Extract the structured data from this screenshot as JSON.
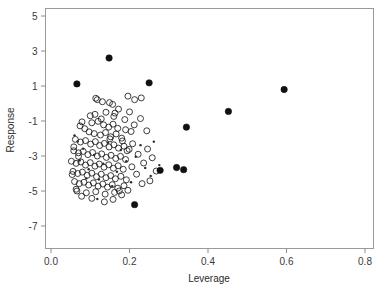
{
  "chart_data": {
    "type": "scatter",
    "title": "",
    "xlabel": "Leverage",
    "ylabel": "Response",
    "xlim": [
      0.0,
      0.82
    ],
    "ylim": [
      -7.6,
      5.5
    ],
    "grid": false,
    "legend": "none",
    "xticks": [
      "0.0",
      "0.2",
      "0.4",
      "0.6",
      "0.8"
    ],
    "xtick_values": [
      0.0,
      0.2,
      0.4,
      0.6,
      0.8
    ],
    "yticks": [
      "5",
      "3",
      "1",
      "-1",
      "-3",
      "-5",
      "-7"
    ],
    "ytick_values": [
      5,
      3,
      1,
      -1,
      -3,
      -5,
      -7
    ],
    "series": [
      {
        "name": "open-circles",
        "marker": "open-circle",
        "marker_size": 3.0,
        "color": "#1c1c1c",
        "points": [
          [
            0.114,
            0.3
          ],
          [
            0.118,
            0.22
          ],
          [
            0.131,
            0.1
          ],
          [
            0.149,
            0.05
          ],
          [
            0.157,
            -0.05
          ],
          [
            0.196,
            0.42
          ],
          [
            0.213,
            0.22
          ],
          [
            0.23,
            0.32
          ],
          [
            0.14,
            -0.5
          ],
          [
            0.163,
            -0.55
          ],
          [
            0.112,
            -0.62
          ],
          [
            0.079,
            -1.05
          ],
          [
            0.104,
            -1.1
          ],
          [
            0.12,
            -1.02
          ],
          [
            0.134,
            -1.22
          ],
          [
            0.147,
            -1.35
          ],
          [
            0.158,
            -1.18
          ],
          [
            0.17,
            -1.42
          ],
          [
            0.19,
            -1.5
          ],
          [
            0.097,
            -1.62
          ],
          [
            0.11,
            -1.72
          ],
          [
            0.126,
            -1.8
          ],
          [
            0.139,
            -1.66
          ],
          [
            0.152,
            -1.9
          ],
          [
            0.166,
            -1.74
          ],
          [
            0.18,
            -1.98
          ],
          [
            0.204,
            -1.6
          ],
          [
            0.062,
            -2.05
          ],
          [
            0.075,
            -2.2
          ],
          [
            0.088,
            -2.12
          ],
          [
            0.101,
            -2.32
          ],
          [
            0.113,
            -2.18
          ],
          [
            0.124,
            -2.4
          ],
          [
            0.136,
            -2.28
          ],
          [
            0.148,
            -2.48
          ],
          [
            0.16,
            -2.36
          ],
          [
            0.172,
            -2.55
          ],
          [
            0.186,
            -2.44
          ],
          [
            0.199,
            -2.62
          ],
          [
            0.058,
            -2.7
          ],
          [
            0.07,
            -2.82
          ],
          [
            0.082,
            -2.74
          ],
          [
            0.094,
            -2.92
          ],
          [
            0.106,
            -2.8
          ],
          [
            0.118,
            -3.0
          ],
          [
            0.129,
            -2.88
          ],
          [
            0.141,
            -3.08
          ],
          [
            0.153,
            -2.96
          ],
          [
            0.165,
            -3.14
          ],
          [
            0.177,
            -3.02
          ],
          [
            0.19,
            -3.2
          ],
          [
            0.052,
            -3.3
          ],
          [
            0.064,
            -3.42
          ],
          [
            0.076,
            -3.34
          ],
          [
            0.088,
            -3.52
          ],
          [
            0.1,
            -3.38
          ],
          [
            0.112,
            -3.58
          ],
          [
            0.123,
            -3.46
          ],
          [
            0.135,
            -3.64
          ],
          [
            0.147,
            -3.5
          ],
          [
            0.159,
            -3.7
          ],
          [
            0.171,
            -3.56
          ],
          [
            0.184,
            -3.76
          ],
          [
            0.056,
            -3.88
          ],
          [
            0.068,
            -4.0
          ],
          [
            0.08,
            -3.92
          ],
          [
            0.092,
            -4.1
          ],
          [
            0.104,
            -3.98
          ],
          [
            0.116,
            -4.18
          ],
          [
            0.128,
            -4.04
          ],
          [
            0.14,
            -4.24
          ],
          [
            0.152,
            -4.12
          ],
          [
            0.164,
            -4.3
          ],
          [
            0.178,
            -4.16
          ],
          [
            0.192,
            -4.36
          ],
          [
            0.06,
            -4.46
          ],
          [
            0.072,
            -4.58
          ],
          [
            0.084,
            -4.5
          ],
          [
            0.096,
            -4.66
          ],
          [
            0.108,
            -4.54
          ],
          [
            0.12,
            -4.72
          ],
          [
            0.132,
            -4.6
          ],
          [
            0.144,
            -4.78
          ],
          [
            0.156,
            -4.64
          ],
          [
            0.17,
            -4.84
          ],
          [
            0.186,
            -4.7
          ],
          [
            0.066,
            -5.0
          ],
          [
            0.09,
            -5.1
          ],
          [
            0.114,
            -5.04
          ],
          [
            0.138,
            -5.18
          ],
          [
            0.162,
            -5.08
          ],
          [
            0.18,
            -5.22
          ],
          [
            0.136,
            -5.62
          ],
          [
            0.158,
            -5.48
          ],
          [
            0.208,
            -2.3
          ],
          [
            0.222,
            -2.9
          ],
          [
            0.236,
            -3.4
          ],
          [
            0.246,
            -2.6
          ],
          [
            0.258,
            -3.1
          ],
          [
            0.268,
            -3.86
          ],
          [
            0.252,
            -4.42
          ],
          [
            0.212,
            -1.22
          ],
          [
            0.228,
            -0.86
          ],
          [
            0.244,
            -1.56
          ],
          [
            0.196,
            -4.96
          ],
          [
            0.15,
            -2.02
          ],
          [
            0.128,
            -0.88
          ],
          [
            0.1,
            -0.7
          ],
          [
            0.086,
            -1.44
          ],
          [
            0.074,
            -1.28
          ],
          [
            0.07,
            -3.02
          ],
          [
            0.058,
            -2.48
          ],
          [
            0.054,
            -4.06
          ],
          [
            0.064,
            -4.9
          ],
          [
            0.078,
            -5.3
          ],
          [
            0.104,
            -5.42
          ],
          [
            0.182,
            -2.14
          ],
          [
            0.194,
            -2.7
          ],
          [
            0.206,
            -3.62
          ],
          [
            0.218,
            -4.04
          ],
          [
            0.232,
            -4.58
          ],
          [
            0.174,
            -5.0
          ],
          [
            0.16,
            -0.74
          ],
          [
            0.172,
            -0.32
          ],
          [
            0.188,
            -0.92
          ],
          [
            0.2,
            -0.48
          ]
        ]
      },
      {
        "name": "small-dots",
        "marker": "dot",
        "marker_size": 1.2,
        "color": "#2a2a2a",
        "points": [
          [
            0.06,
            -1.82
          ],
          [
            0.073,
            -3.26
          ],
          [
            0.082,
            -2.58
          ],
          [
            0.096,
            -3.76
          ],
          [
            0.11,
            -2.94
          ],
          [
            0.122,
            -4.34
          ],
          [
            0.133,
            -3.44
          ],
          [
            0.145,
            -2.24
          ],
          [
            0.156,
            -4.72
          ],
          [
            0.168,
            -3.9
          ],
          [
            0.178,
            -2.66
          ],
          [
            0.192,
            -3.3
          ],
          [
            0.204,
            -4.5
          ],
          [
            0.216,
            -3.04
          ],
          [
            0.228,
            -2.38
          ],
          [
            0.24,
            -3.68
          ],
          [
            0.254,
            -4.14
          ],
          [
            0.118,
            -5.46
          ],
          [
            0.09,
            -4.28
          ],
          [
            0.068,
            -2.16
          ],
          [
            0.262,
            -2.18
          ],
          [
            0.276,
            -3.52
          ]
        ]
      },
      {
        "name": "filled-circles",
        "marker": "filled-circle",
        "marker_size": 3.2,
        "color": "#111111",
        "points": [
          [
            0.148,
            2.6
          ],
          [
            0.066,
            1.12
          ],
          [
            0.25,
            1.18
          ],
          [
            0.594,
            0.8
          ],
          [
            0.452,
            -0.45
          ],
          [
            0.345,
            -1.35
          ],
          [
            0.278,
            -3.82
          ],
          [
            0.32,
            -3.66
          ],
          [
            0.213,
            -5.78
          ],
          [
            0.338,
            -3.78
          ]
        ]
      }
    ]
  },
  "axis": {
    "x_title": "Leverage",
    "y_title": "Response"
  }
}
